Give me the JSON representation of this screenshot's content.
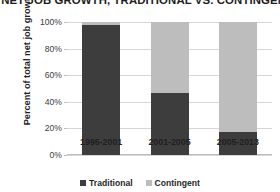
{
  "chart_data": {
    "type": "bar",
    "subtype": "stacked-percent-column",
    "title": ": NET JOB GROWTH, TRADITIONAL VS. CONTINGEN",
    "xlabel": "",
    "ylabel": "Percent of total net job growth",
    "categories": [
      "1995-2001",
      "2001-2005",
      "2005-2013"
    ],
    "series": [
      {
        "name": "Traditional",
        "color": "#3d3d3d",
        "values": [
          98,
          47,
          17
        ]
      },
      {
        "name": "Contingent",
        "color": "#bdbdbd",
        "values": [
          2,
          53,
          83
        ]
      }
    ],
    "ylim": [
      0,
      100
    ],
    "yticks": [
      "0%",
      "20%",
      "40%",
      "60%",
      "80%",
      "100%"
    ],
    "ytick_values": [
      0,
      20,
      40,
      60,
      80,
      100
    ],
    "grid": true,
    "legend_position": "bottom"
  },
  "colors": {
    "traditional": "#3d3d3d",
    "contingent": "#bdbdbd",
    "gridline": "#d6d6d6",
    "axis": "#bdbdbd",
    "text": "#1f1f1f",
    "background": "#ffffff"
  }
}
